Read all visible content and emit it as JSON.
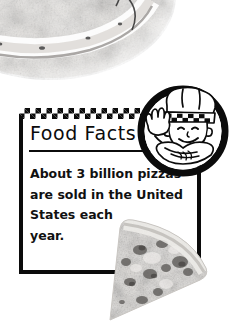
{
  "page": {
    "background_color": "#ffffff",
    "width": 234,
    "height": 330
  },
  "fact_box": {
    "title": "Food Facts",
    "border_color": "#0b0b0b",
    "body_lines": [
      "About 3 billion pizzas",
      "are sold in the United",
      "States each",
      "year."
    ],
    "body_text": "About 3 billion pizzas are sold in the United States each year."
  },
  "decorations": {
    "checker_band": "checkered-band",
    "title_rule": "title-underline",
    "chef_badge": "chef-mascot-icon",
    "pizza_photo_top": "pizza-crust-photo",
    "pizza_slice_bottom": "pizza-slice-photo"
  }
}
